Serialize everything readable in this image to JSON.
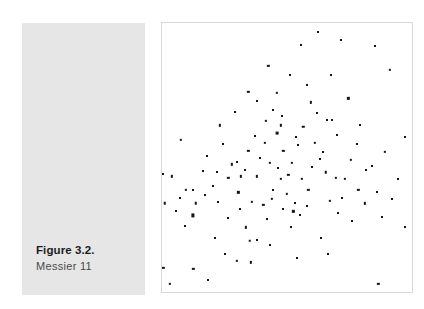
{
  "figure": {
    "number_label": "Figure 3.2.",
    "subtitle_label": "Messier 11",
    "panel_color": "#e6e6e6",
    "point_color": "#151515",
    "plot_border_color": "#d8d8d8",
    "background_color": "#ffffff"
  },
  "chart_data": {
    "type": "scatter",
    "title": "Figure 3.2.",
    "subtitle": "Messier 11",
    "xlabel": "",
    "ylabel": "",
    "xlim": [
      0,
      100
    ],
    "ylim": [
      0,
      100
    ],
    "grid": false,
    "legend": null,
    "axis_ticks": false,
    "series": [
      {
        "name": "stars",
        "marker": "square",
        "color": "#151515",
        "count": 120,
        "points": [
          {
            "x": 42.5,
            "y": 84.0,
            "s": 2.3
          },
          {
            "x": 71.5,
            "y": 93.5,
            "s": 2.0
          },
          {
            "x": 34.5,
            "y": 74.5,
            "s": 2.3
          },
          {
            "x": 46.0,
            "y": 74.0,
            "s": 2.3
          },
          {
            "x": 91.0,
            "y": 82.5,
            "s": 2.3
          },
          {
            "x": 51.0,
            "y": 80.5,
            "s": 2.0
          },
          {
            "x": 23.0,
            "y": 62.0,
            "s": 2.3
          },
          {
            "x": 47.5,
            "y": 62.0,
            "s": 2.3
          },
          {
            "x": 7.5,
            "y": 56.5,
            "s": 2.3
          },
          {
            "x": 97.0,
            "y": 57.5,
            "s": 2.0
          },
          {
            "x": 30.0,
            "y": 48.5,
            "s": 2.0
          },
          {
            "x": 48.5,
            "y": 52.5,
            "s": 2.3
          },
          {
            "x": 31.5,
            "y": 43.0,
            "s": 2.3
          },
          {
            "x": 50.5,
            "y": 43.5,
            "s": 2.3
          },
          {
            "x": 53.0,
            "y": 33.0,
            "s": 2.0
          },
          {
            "x": 52.5,
            "y": 30.0,
            "s": 2.3
          },
          {
            "x": 38.0,
            "y": 71.0,
            "s": 2.0
          },
          {
            "x": 59.5,
            "y": 70.5,
            "s": 2.3
          },
          {
            "x": 74.5,
            "y": 72.0,
            "s": 2.3
          },
          {
            "x": 41.5,
            "y": 63.5,
            "s": 2.3
          },
          {
            "x": 56.5,
            "y": 61.5,
            "s": 2.5
          },
          {
            "x": 66.0,
            "y": 64.0,
            "s": 2.0
          },
          {
            "x": 68.0,
            "y": 64.0,
            "s": 2.0
          },
          {
            "x": 37.0,
            "y": 58.0,
            "s": 2.0
          },
          {
            "x": 46.0,
            "y": 59.0,
            "s": 2.8
          },
          {
            "x": 78.0,
            "y": 55.0,
            "s": 2.0
          },
          {
            "x": 34.5,
            "y": 52.5,
            "s": 2.3
          },
          {
            "x": 89.0,
            "y": 52.0,
            "s": 2.3
          },
          {
            "x": 28.0,
            "y": 47.5,
            "s": 2.3
          },
          {
            "x": 33.0,
            "y": 45.5,
            "s": 2.0
          },
          {
            "x": 43.0,
            "y": 48.0,
            "s": 2.3
          },
          {
            "x": 52.0,
            "y": 48.0,
            "s": 2.3
          },
          {
            "x": 60.0,
            "y": 46.5,
            "s": 2.0
          },
          {
            "x": 0.5,
            "y": 44.0,
            "s": 2.0
          },
          {
            "x": 4.0,
            "y": 43.0,
            "s": 2.3
          },
          {
            "x": 26.5,
            "y": 42.5,
            "s": 2.3
          },
          {
            "x": 38.0,
            "y": 43.0,
            "s": 2.3
          },
          {
            "x": 47.5,
            "y": 42.0,
            "s": 2.3
          },
          {
            "x": 56.0,
            "y": 42.0,
            "s": 2.3
          },
          {
            "x": 65.5,
            "y": 44.5,
            "s": 2.5
          },
          {
            "x": 69.5,
            "y": 42.5,
            "s": 2.3
          },
          {
            "x": 73.0,
            "y": 42.0,
            "s": 2.3
          },
          {
            "x": 94.5,
            "y": 42.0,
            "s": 2.0
          },
          {
            "x": -1.0,
            "y": 38.5,
            "s": 2.3
          },
          {
            "x": 9.5,
            "y": 38.0,
            "s": 2.3
          },
          {
            "x": 12.5,
            "y": 38.0,
            "s": 2.0
          },
          {
            "x": 30.5,
            "y": 37.0,
            "s": 2.3
          },
          {
            "x": 50.0,
            "y": 36.5,
            "s": 2.3
          },
          {
            "x": 78.5,
            "y": 38.0,
            "s": 2.3
          },
          {
            "x": 86.0,
            "y": 37.0,
            "s": 2.0
          },
          {
            "x": 1.0,
            "y": 33.0,
            "s": 2.5
          },
          {
            "x": 13.5,
            "y": 33.0,
            "s": 2.5
          },
          {
            "x": 40.5,
            "y": 32.5,
            "s": 2.3
          },
          {
            "x": 81.0,
            "y": 33.0,
            "s": 2.3
          },
          {
            "x": 12.5,
            "y": 28.5,
            "s": 3.2
          },
          {
            "x": 26.5,
            "y": 27.5,
            "s": 2.0
          },
          {
            "x": 55.0,
            "y": 28.5,
            "s": 2.0
          },
          {
            "x": 88.0,
            "y": 28.0,
            "s": 2.0
          },
          {
            "x": 51.5,
            "y": 24.0,
            "s": 2.0
          },
          {
            "x": 97.0,
            "y": 24.0,
            "s": 2.0
          },
          {
            "x": 62.5,
            "y": 96.5,
            "s": 2.0
          },
          {
            "x": 63.5,
            "y": 20.0,
            "s": 2.0
          },
          {
            "x": 36.0,
            "y": 33.5,
            "s": 2.3
          },
          {
            "x": 44.0,
            "y": 34.5,
            "s": 2.3
          },
          {
            "x": 61.0,
            "y": 55.5,
            "s": 2.3
          },
          {
            "x": 64.5,
            "y": 52.0,
            "s": 2.0
          },
          {
            "x": 54.5,
            "y": 54.5,
            "s": 2.0
          },
          {
            "x": 41.0,
            "y": 55.5,
            "s": 2.3
          },
          {
            "x": 24.5,
            "y": 55.0,
            "s": 2.0
          },
          {
            "x": 70.0,
            "y": 58.5,
            "s": 2.0
          },
          {
            "x": 75.5,
            "y": 49.0,
            "s": 2.3
          },
          {
            "x": 81.5,
            "y": 45.5,
            "s": 2.0
          },
          {
            "x": 18.0,
            "y": 50.5,
            "s": 2.0
          },
          {
            "x": 20.5,
            "y": 39.5,
            "s": 2.0
          },
          {
            "x": 44.5,
            "y": 38.0,
            "s": 2.0
          },
          {
            "x": 58.5,
            "y": 38.0,
            "s": 2.3
          },
          {
            "x": 72.0,
            "y": 35.0,
            "s": 2.0
          },
          {
            "x": 67.0,
            "y": 34.0,
            "s": 2.3
          },
          {
            "x": 33.5,
            "y": 24.0,
            "s": 2.3
          },
          {
            "x": 21.0,
            "y": 20.0,
            "s": 2.0
          },
          {
            "x": 43.0,
            "y": 17.5,
            "s": 2.0
          },
          {
            "x": 66.5,
            "y": 14.0,
            "s": 2.0
          },
          {
            "x": 30.0,
            "y": 11.5,
            "s": 2.3
          },
          {
            "x": 12.5,
            "y": 8.5,
            "s": 2.3
          },
          {
            "x": 18.5,
            "y": 4.5,
            "s": 2.0
          },
          {
            "x": 3.0,
            "y": 3.0,
            "s": 2.3
          },
          {
            "x": 86.5,
            "y": 3.0,
            "s": 2.3
          },
          {
            "x": 35.0,
            "y": 19.0,
            "s": 2.5
          },
          {
            "x": 38.0,
            "y": 19.5,
            "s": 2.0
          },
          {
            "x": 35.5,
            "y": 11.0,
            "s": 2.3
          },
          {
            "x": 0.5,
            "y": 9.0,
            "s": 2.3
          },
          {
            "x": 85.0,
            "y": 91.5,
            "s": 2.0
          },
          {
            "x": 55.5,
            "y": 92.0,
            "s": 2.0
          },
          {
            "x": 48.0,
            "y": 65.5,
            "s": 2.0
          },
          {
            "x": 44.5,
            "y": 67.5,
            "s": 2.0
          },
          {
            "x": 53.5,
            "y": 57.5,
            "s": 2.0
          },
          {
            "x": 39.0,
            "y": 50.0,
            "s": 2.0
          },
          {
            "x": 63.0,
            "y": 49.5,
            "s": 2.0
          },
          {
            "x": 16.5,
            "y": 45.0,
            "s": 2.0
          },
          {
            "x": 22.0,
            "y": 44.5,
            "s": 2.0
          },
          {
            "x": 7.0,
            "y": 35.0,
            "s": 2.0
          },
          {
            "x": 5.5,
            "y": 30.0,
            "s": 2.0
          },
          {
            "x": 17.0,
            "y": 36.0,
            "s": 2.0
          },
          {
            "x": 48.5,
            "y": 31.0,
            "s": 2.0
          },
          {
            "x": 58.0,
            "y": 32.0,
            "s": 2.0
          },
          {
            "x": 70.5,
            "y": 29.5,
            "s": 2.0
          },
          {
            "x": 42.0,
            "y": 27.0,
            "s": 2.0
          },
          {
            "x": 31.0,
            "y": 31.0,
            "s": 2.0
          },
          {
            "x": 22.5,
            "y": 33.5,
            "s": 2.0
          },
          {
            "x": 9.0,
            "y": 24.5,
            "s": 2.0
          },
          {
            "x": 62.0,
            "y": 66.5,
            "s": 2.0
          },
          {
            "x": 58.0,
            "y": 77.0,
            "s": 2.0
          },
          {
            "x": 29.0,
            "y": 67.0,
            "s": 2.0
          },
          {
            "x": 67.5,
            "y": 80.5,
            "s": 2.0
          },
          {
            "x": 79.0,
            "y": 62.0,
            "s": 2.0
          },
          {
            "x": 84.0,
            "y": 47.0,
            "s": 2.0
          },
          {
            "x": 92.0,
            "y": 34.5,
            "s": 2.0
          },
          {
            "x": 76.0,
            "y": 26.5,
            "s": 2.0
          },
          {
            "x": 54.0,
            "y": 12.5,
            "s": 2.0
          },
          {
            "x": 25.0,
            "y": 14.0,
            "s": 2.0
          },
          {
            "x": 46.5,
            "y": 46.0,
            "s": 2.0
          }
        ]
      }
    ]
  }
}
